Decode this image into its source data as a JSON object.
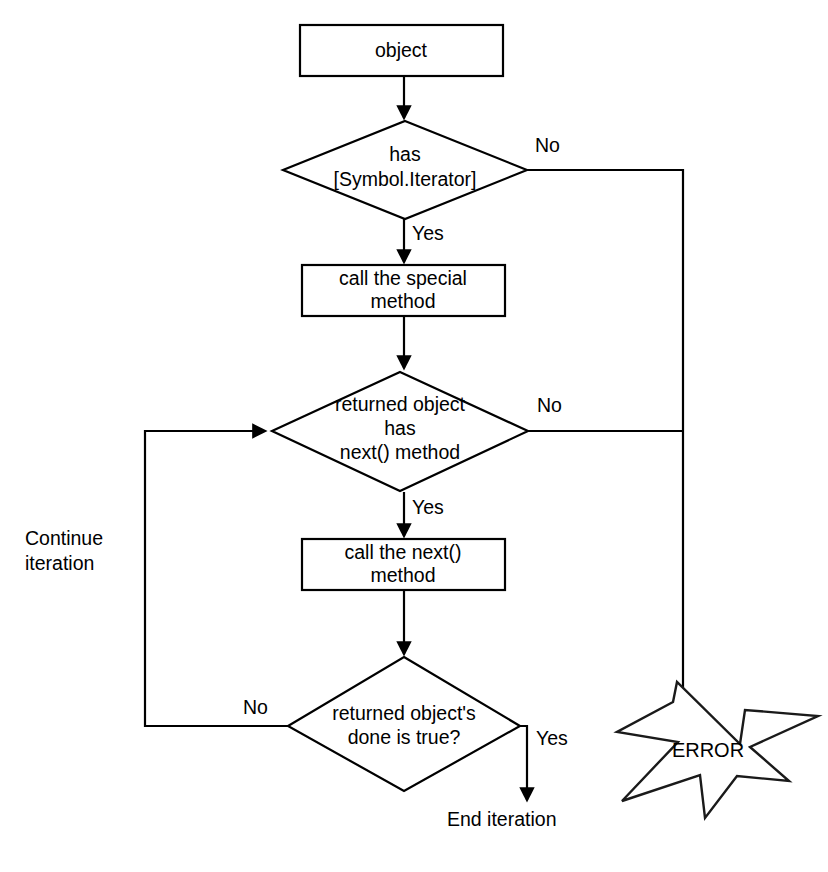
{
  "diagram": {
    "background_color": "#ffffff",
    "line_color": "#000000"
  },
  "nodes": {
    "start_box": {
      "label": "object",
      "shape": "rectangle"
    },
    "decision_symbol_iterator": {
      "line1": "has",
      "line2": "[Symbol.Iterator]",
      "shape": "diamond"
    },
    "process_special_method": {
      "line1": "call the special",
      "line2": "method",
      "shape": "rectangle"
    },
    "decision_next_method": {
      "line1": "returned object",
      "line2": "has",
      "line3": "next() method",
      "shape": "diamond"
    },
    "process_next_method": {
      "line1": "call the next()",
      "line2": "method",
      "shape": "rectangle"
    },
    "decision_done_true": {
      "line1": "returned object's",
      "line2": "done is true?",
      "shape": "diamond"
    },
    "error_burst": {
      "label": "ERROR",
      "shape": "zigzag-burst"
    }
  },
  "edge_labels": {
    "symbol_iterator_no": "No",
    "symbol_iterator_yes": "Yes",
    "next_method_no": "No",
    "next_method_yes": "Yes",
    "done_no": "No",
    "done_yes": "Yes"
  },
  "free_labels": {
    "continue_iteration_line1": "Continue",
    "continue_iteration_line2": "iteration",
    "end_iteration": "End iteration"
  }
}
